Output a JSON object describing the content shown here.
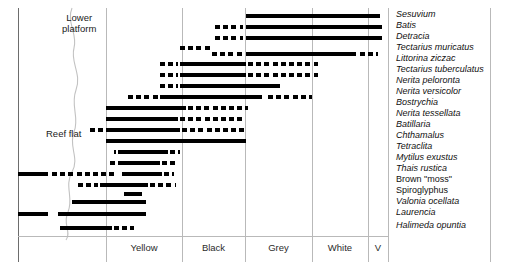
{
  "figure": {
    "title": "",
    "left_border_x": 18,
    "right_border_x": 490,
    "plot_top": 8,
    "axis_y": 236,
    "bottom_y": 262
  },
  "regions": [
    {
      "name": "lower-platform",
      "label_line1": "Lower",
      "label_line2": "platform",
      "x": 62,
      "y": 12
    },
    {
      "name": "reef-flat",
      "label_line1": "Reef flat",
      "label_line2": "",
      "x": 46,
      "y": 128
    }
  ],
  "zones": [
    {
      "name": "yellow",
      "label": "Yellow",
      "x0": 106,
      "x1": 182
    },
    {
      "name": "black",
      "label": "Black",
      "x0": 182,
      "x1": 245
    },
    {
      "name": "grey",
      "label": "Grey",
      "x0": 245,
      "x1": 312
    },
    {
      "name": "white",
      "label": "White",
      "x0": 312,
      "x1": 368
    },
    {
      "name": "v",
      "label": "V",
      "x0": 368,
      "x1": 388
    }
  ],
  "gridlines_x": [
    18,
    106,
    182,
    245,
    312,
    368,
    388
  ],
  "chart_data": {
    "type": "bar",
    "xlabel": "Shore zone",
    "ylabel": "Species",
    "xlim": [
      18,
      388
    ],
    "grid": true,
    "legend": "none",
    "axis_categories": [
      "Yellow",
      "Black",
      "Grey",
      "White",
      "V"
    ],
    "categories": [
      "Sesuvium",
      "Batis",
      "Detracia",
      "Tectarius muricatus",
      "Littorina ziczac",
      "Tectarius tuberculatus",
      "Nerita peloronta",
      "Nerita versicolor",
      "Bostrychia",
      "Nerita tessellata",
      "Batillaria",
      "Chthamalus",
      "Tetraclita",
      "Mytilus exustus",
      "Thais rustica",
      "Brown \"moss\"",
      "Spiroglyphus",
      "Valonia ocellata",
      "Laurencia",
      "Halimeda opuntia"
    ],
    "series": [
      {
        "name": "Sesuvium",
        "y": 14,
        "solid": [
          [
            246,
            380
          ]
        ],
        "dashed": []
      },
      {
        "name": "Batis",
        "y": 25,
        "solid": [
          [
            246,
            382
          ]
        ],
        "dashed": [
          [
            215,
            243
          ]
        ]
      },
      {
        "name": "Detracia",
        "y": 36,
        "solid": [
          [
            246,
            382
          ]
        ],
        "dashed": [
          [
            215,
            243
          ]
        ]
      },
      {
        "name": "Tectarius muricatus",
        "y": 46,
        "solid": [],
        "dashed": [
          [
            180,
            212
          ]
        ]
      },
      {
        "name": "Tectarius muricatus-b",
        "y": 52,
        "solid": [
          [
            246,
            356
          ]
        ],
        "dashed": [
          [
            212,
            244
          ],
          [
            290,
            330
          ],
          [
            360,
            378
          ]
        ]
      },
      {
        "name": "Littorina ziczac",
        "y": 62,
        "solid": [
          [
            180,
            246
          ]
        ],
        "dashed": [
          [
            160,
            178
          ],
          [
            248,
            318
          ]
        ]
      },
      {
        "name": "Tectarius tuberculatus",
        "y": 73,
        "solid": [
          [
            180,
            246
          ]
        ],
        "dashed": [
          [
            160,
            178
          ],
          [
            248,
            318
          ]
        ]
      },
      {
        "name": "Nerita peloronta",
        "y": 84,
        "solid": [
          [
            180,
            280
          ]
        ],
        "dashed": [
          [
            160,
            178
          ]
        ]
      },
      {
        "name": "Nerita versicolor",
        "y": 95,
        "solid": [
          [
            160,
            262
          ]
        ],
        "dashed": [
          [
            128,
            158
          ],
          [
            268,
            312
          ]
        ]
      },
      {
        "name": "Bostrychia",
        "y": 106,
        "solid": [
          [
            106,
            186
          ]
        ],
        "dashed": [
          [
            188,
            248
          ]
        ]
      },
      {
        "name": "Nerita tessellata",
        "y": 117,
        "solid": [
          [
            106,
            178
          ]
        ],
        "dashed": [
          [
            180,
            244
          ]
        ]
      },
      {
        "name": "Batillaria",
        "y": 128,
        "solid": [
          [
            106,
            180
          ]
        ],
        "dashed": [
          [
            90,
            104
          ],
          [
            182,
            245
          ]
        ]
      },
      {
        "name": "Chthamalus",
        "y": 139,
        "solid": [
          [
            106,
            246
          ]
        ],
        "dashed": []
      },
      {
        "name": "Tetraclita",
        "y": 150,
        "solid": [
          [
            118,
            168
          ]
        ],
        "dashed": [
          [
            114,
            116
          ],
          [
            170,
            180
          ]
        ]
      },
      {
        "name": "Mytilus exustus",
        "y": 161,
        "solid": [
          [
            118,
            160
          ]
        ],
        "dashed": [
          [
            110,
            116
          ],
          [
            162,
            176
          ]
        ]
      },
      {
        "name": "Thais rustica",
        "y": 172,
        "solid": [
          [
            18,
            48
          ],
          [
            122,
            162
          ]
        ],
        "dashed": [
          [
            52,
            118
          ],
          [
            164,
            174
          ]
        ]
      },
      {
        "name": "Brown moss",
        "y": 183,
        "solid": [
          [
            100,
            148
          ]
        ],
        "dashed": [
          [
            78,
            98
          ],
          [
            150,
            176
          ]
        ]
      },
      {
        "name": "Spiroglyphus",
        "y": 192,
        "solid": [
          [
            124,
            142
          ]
        ],
        "dashed": []
      },
      {
        "name": "Valonia ocellata",
        "y": 200,
        "solid": [
          [
            72,
            146
          ]
        ],
        "dashed": []
      },
      {
        "name": "Laurencia",
        "y": 212,
        "solid": [
          [
            18,
            48
          ],
          [
            58,
            146
          ]
        ],
        "dashed": []
      },
      {
        "name": "Halimeda opuntia",
        "y": 226,
        "solid": [
          [
            60,
            112
          ]
        ],
        "dashed": [
          [
            114,
            134
          ]
        ]
      }
    ]
  },
  "species_labels": [
    {
      "text": "Sesuvium",
      "y": 9,
      "italic": true
    },
    {
      "text": "Batis",
      "y": 20,
      "italic": true
    },
    {
      "text": "Detracia",
      "y": 31,
      "italic": true
    },
    {
      "text": "Tectarius muricatus",
      "y": 42,
      "italic": true
    },
    {
      "text": "Littorina ziczac",
      "y": 53,
      "italic": true
    },
    {
      "text": "Tectarius tuberculatus",
      "y": 64,
      "italic": true
    },
    {
      "text": "Nerita peloronta",
      "y": 75,
      "italic": true
    },
    {
      "text": "Nerita versicolor",
      "y": 86,
      "italic": true
    },
    {
      "text": "Bostrychia",
      "y": 97,
      "italic": true
    },
    {
      "text": "Nerita tessellata",
      "y": 108,
      "italic": true
    },
    {
      "text": "Batillaria",
      "y": 119,
      "italic": true
    },
    {
      "text": "Chthamalus",
      "y": 130,
      "italic": true
    },
    {
      "text": "Tetraclita",
      "y": 141,
      "italic": true
    },
    {
      "text": "Mytilus exustus",
      "y": 152,
      "italic": true
    },
    {
      "text": "Thais rustica",
      "y": 163,
      "italic": true
    },
    {
      "text": "Brown \"moss\"",
      "y": 174,
      "italic": false
    },
    {
      "text": "Spiroglyphus",
      "y": 185,
      "italic": false
    },
    {
      "text": "Valonia ocellata",
      "y": 196,
      "italic": true
    },
    {
      "text": "Laurencia",
      "y": 207,
      "italic": true
    },
    {
      "text": "Halimeda opuntia",
      "y": 220,
      "italic": true
    }
  ]
}
